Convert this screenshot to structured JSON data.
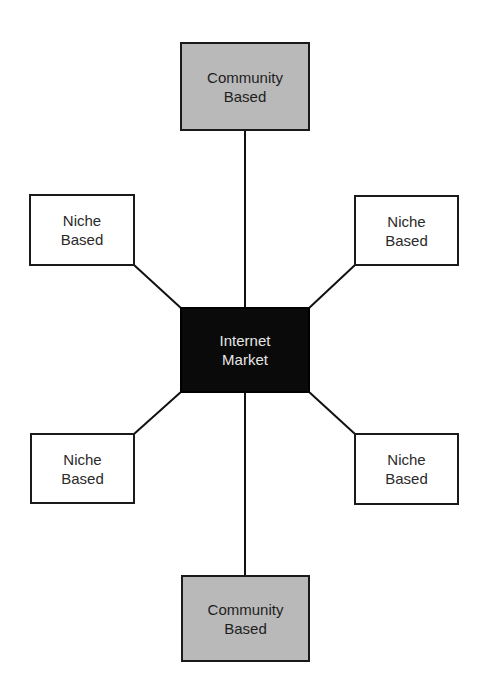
{
  "diagram": {
    "type": "hub-and-spoke",
    "center": {
      "id": "internet-market",
      "line1": "Internet",
      "line2": "Market",
      "fill": "#0a0a0a",
      "text_color": "#e6e6e6"
    },
    "nodes": [
      {
        "id": "community-top",
        "kind": "community",
        "line1": "Community",
        "line2": "Based",
        "fill": "#b9b9b9"
      },
      {
        "id": "niche-top-left",
        "kind": "niche",
        "line1": "Niche",
        "line2": "Based",
        "fill": "#ffffff"
      },
      {
        "id": "niche-top-right",
        "kind": "niche",
        "line1": "Niche",
        "line2": "Based",
        "fill": "#ffffff"
      },
      {
        "id": "niche-bottom-left",
        "kind": "niche",
        "line1": "Niche",
        "line2": "Based",
        "fill": "#ffffff"
      },
      {
        "id": "niche-bottom-right",
        "kind": "niche",
        "line1": "Niche",
        "line2": "Based",
        "fill": "#ffffff"
      },
      {
        "id": "community-bottom",
        "kind": "community",
        "line1": "Community",
        "line2": "Based",
        "fill": "#b9b9b9"
      }
    ],
    "edges": [
      {
        "from": "internet-market",
        "to": "community-top"
      },
      {
        "from": "internet-market",
        "to": "niche-top-left"
      },
      {
        "from": "internet-market",
        "to": "niche-top-right"
      },
      {
        "from": "internet-market",
        "to": "niche-bottom-left"
      },
      {
        "from": "internet-market",
        "to": "niche-bottom-right"
      },
      {
        "from": "internet-market",
        "to": "community-bottom"
      }
    ]
  }
}
